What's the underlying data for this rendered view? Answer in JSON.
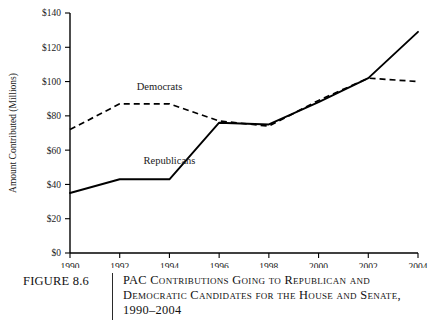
{
  "figure": {
    "number_label": "FIGURE 8.6",
    "caption_lines": [
      "PAC Contributions Going to Republican and",
      "Democratic Candidates for the House and Senate,",
      "1990–2004"
    ]
  },
  "chart_data": {
    "type": "line",
    "title": "",
    "xlabel": "",
    "ylabel": "Amount Contributed (Millions)",
    "x": [
      1990,
      1992,
      1994,
      1996,
      1998,
      2000,
      2002,
      2004
    ],
    "xtick_labels": [
      "1990",
      "1992",
      "1994",
      "1996",
      "1998",
      "2000",
      "2002",
      "2004"
    ],
    "xlim": [
      1990,
      2004
    ],
    "ylim": [
      0,
      140
    ],
    "ytick_values": [
      0,
      20,
      40,
      60,
      80,
      100,
      120,
      140
    ],
    "ytick_labels": [
      "$0",
      "$20",
      "$40",
      "$60",
      "$80",
      "$100",
      "$120",
      "$140"
    ],
    "grid": false,
    "legend_position": "inline-annotation",
    "series": [
      {
        "name": "Republicans",
        "style": "solid",
        "color": "#000000",
        "label_x": 1994.0,
        "label_y": 52,
        "values": [
          35,
          43,
          43,
          76,
          75,
          88,
          102,
          129
        ]
      },
      {
        "name": "Democrats",
        "style": "dashed",
        "color": "#000000",
        "label_x": 1993.6,
        "label_y": 95,
        "values": [
          72,
          87,
          87,
          77,
          74,
          89,
          102,
          100
        ]
      }
    ]
  }
}
